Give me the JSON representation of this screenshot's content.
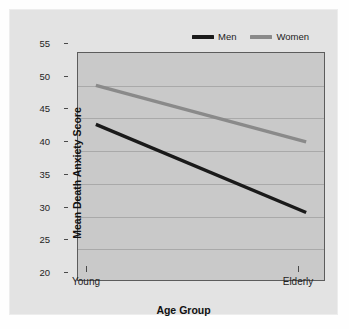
{
  "chart_data": {
    "type": "line",
    "title": "",
    "subtitle": "",
    "xlabel": "Age Group",
    "ylabel": "Mean Death Anxiety Score",
    "categories": [
      "Young",
      "Elderly"
    ],
    "x": [
      0,
      1
    ],
    "series": [
      {
        "name": "Men",
        "values": [
          44.0,
          30.4
        ],
        "color": "#1a1a1a"
      },
      {
        "name": "Women",
        "values": [
          50.0,
          41.3
        ],
        "color": "#8a8a8a"
      }
    ],
    "ylim": [
      20,
      55
    ],
    "yticks": [
      20,
      25,
      30,
      35,
      40,
      45,
      50,
      55
    ],
    "ytick_labels": [
      "20",
      "25",
      "30",
      "35",
      "40",
      "45",
      "50",
      "55"
    ],
    "xtick_labels": [
      "Young",
      "Elderly"
    ],
    "grid": "horizontal",
    "legend_position": "top-right",
    "legend": [
      "Men",
      "Women"
    ],
    "plot_background": "#c9c9c9",
    "figure_background": "#e3e3e3",
    "annotations": []
  }
}
